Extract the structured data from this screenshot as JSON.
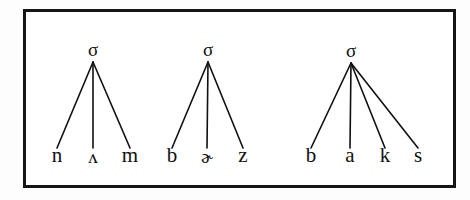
{
  "figure": {
    "type": "syllable-tree-diagram",
    "border_color": "#151515",
    "ink_color": "#101010",
    "background_color": "#ffffff",
    "trees": [
      {
        "id": "tree-1",
        "root_label": "σ",
        "root_x": 93,
        "root_y": 62,
        "leaf_y": 148,
        "leaves": [
          {
            "label": "n",
            "x": 57,
            "ipa": false
          },
          {
            "label": "ʌ",
            "x": 93,
            "ipa": true
          },
          {
            "label": "m",
            "x": 130,
            "ipa": false
          }
        ]
      },
      {
        "id": "tree-2",
        "root_label": "σ",
        "root_x": 208,
        "root_y": 62,
        "leaf_y": 148,
        "leaves": [
          {
            "label": "b",
            "x": 172,
            "ipa": false
          },
          {
            "label": "ɚ",
            "x": 207,
            "ipa": true
          },
          {
            "label": "z",
            "x": 243,
            "ipa": false
          }
        ]
      },
      {
        "id": "tree-3",
        "root_label": "σ",
        "root_x": 351,
        "root_y": 63,
        "leaf_y": 148,
        "leaves": [
          {
            "label": "b",
            "x": 311,
            "ipa": false
          },
          {
            "label": "a",
            "x": 350,
            "ipa": false
          },
          {
            "label": "k",
            "x": 385,
            "ipa": false
          },
          {
            "label": "s",
            "x": 418,
            "ipa": false
          }
        ]
      }
    ]
  }
}
